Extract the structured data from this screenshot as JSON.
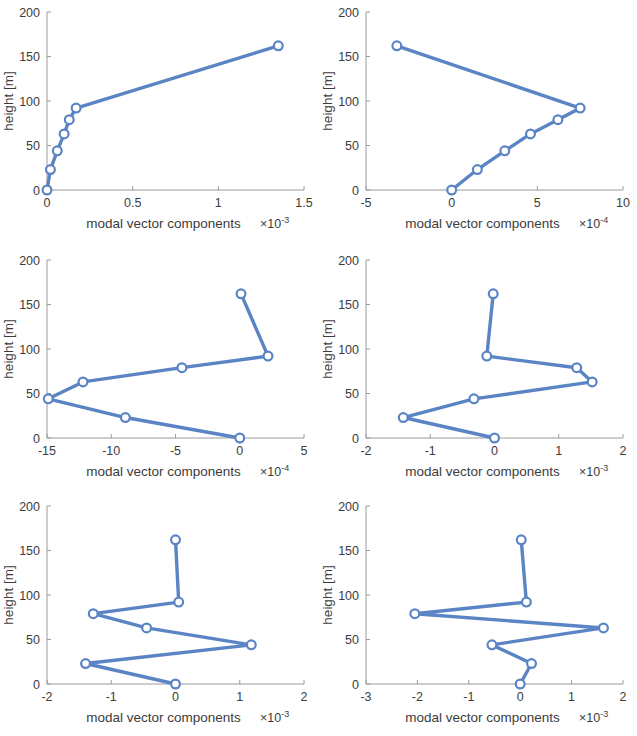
{
  "figure": {
    "title": "",
    "rows": 3,
    "cols": 2,
    "background": "#ffffff",
    "series_color": "#5b84c4"
  },
  "common": {
    "xlabel": "modal vector components",
    "ylabel": "height [m]",
    "y_ticks": [
      0,
      50,
      100,
      150,
      200
    ],
    "y_tick_labels": [
      "0",
      "50",
      "100",
      "150",
      "200"
    ],
    "ylim": [
      0,
      200
    ],
    "exp_times": "×",
    "exp_base": "10"
  },
  "chart_data": [
    {
      "id": "panel-1",
      "type": "line",
      "title": "",
      "xlabel": "modal vector components",
      "ylabel": "height [m]",
      "x_exponent": "-3",
      "x_exponent_label": "×10⁻³",
      "xlim": [
        0,
        1.5
      ],
      "ylim": [
        0,
        200
      ],
      "x_ticks": [
        0,
        0.5,
        1,
        1.5
      ],
      "x_tick_labels": [
        "0",
        "0.5",
        "1",
        "1.5"
      ],
      "y_ticks": [
        0,
        50,
        100,
        150,
        200
      ],
      "y_tick_labels": [
        "0",
        "50",
        "100",
        "150",
        "200"
      ],
      "grid": false,
      "legend": null,
      "series": [
        {
          "name": "mode 1",
          "x": [
            0.0,
            0.02,
            0.06,
            0.1,
            0.13,
            0.17,
            1.35
          ],
          "y": [
            0,
            23,
            44,
            63,
            79,
            92,
            162
          ]
        }
      ]
    },
    {
      "id": "panel-2",
      "type": "line",
      "title": "",
      "xlabel": "modal vector components",
      "ylabel": "height [m]",
      "x_exponent": "-4",
      "x_exponent_label": "×10⁻⁴",
      "xlim": [
        -5,
        10
      ],
      "ylim": [
        0,
        200
      ],
      "x_ticks": [
        -5,
        0,
        5,
        10
      ],
      "x_tick_labels": [
        "-5",
        "0",
        "5",
        "10"
      ],
      "y_ticks": [
        0,
        50,
        100,
        150,
        200
      ],
      "y_tick_labels": [
        "0",
        "50",
        "100",
        "150",
        "200"
      ],
      "grid": false,
      "legend": null,
      "series": [
        {
          "name": "mode 2",
          "x": [
            0.0,
            1.5,
            3.1,
            4.6,
            6.2,
            7.5,
            -3.2
          ],
          "y": [
            0,
            23,
            44,
            63,
            79,
            92,
            162
          ]
        }
      ]
    },
    {
      "id": "panel-3",
      "type": "line",
      "title": "",
      "xlabel": "modal vector components",
      "ylabel": "height [m]",
      "x_exponent": "-4",
      "x_exponent_label": "×10⁻⁴",
      "xlim": [
        -15,
        5
      ],
      "ylim": [
        0,
        200
      ],
      "x_ticks": [
        -15,
        -10,
        -5,
        0,
        5
      ],
      "x_tick_labels": [
        "-15",
        "-10",
        "-5",
        "0",
        "5"
      ],
      "y_ticks": [
        0,
        50,
        100,
        150,
        200
      ],
      "y_tick_labels": [
        "0",
        "50",
        "100",
        "150",
        "200"
      ],
      "grid": false,
      "legend": null,
      "series": [
        {
          "name": "mode 3",
          "x": [
            0.0,
            -8.9,
            -14.9,
            -12.2,
            -4.5,
            2.2,
            0.1
          ],
          "y": [
            0,
            23,
            44,
            63,
            79,
            92,
            162
          ]
        }
      ]
    },
    {
      "id": "panel-4",
      "type": "line",
      "title": "",
      "xlabel": "modal vector components",
      "ylabel": "height [m]",
      "x_exponent": "-3",
      "x_exponent_label": "×10⁻³",
      "xlim": [
        -2,
        2
      ],
      "ylim": [
        0,
        200
      ],
      "x_ticks": [
        -2,
        -1,
        0,
        1,
        2
      ],
      "x_tick_labels": [
        "-2",
        "-1",
        "0",
        "1",
        "2"
      ],
      "y_ticks": [
        0,
        50,
        100,
        150,
        200
      ],
      "y_tick_labels": [
        "0",
        "50",
        "100",
        "150",
        "200"
      ],
      "grid": false,
      "legend": null,
      "series": [
        {
          "name": "mode 4",
          "x": [
            0.0,
            -1.42,
            -0.32,
            1.52,
            1.28,
            -0.12,
            -0.02
          ],
          "y": [
            0,
            23,
            44,
            63,
            79,
            92,
            162
          ]
        }
      ]
    },
    {
      "id": "panel-5",
      "type": "line",
      "title": "",
      "xlabel": "modal vector components",
      "ylabel": "height [m]",
      "x_exponent": "-3",
      "x_exponent_label": "×10⁻³",
      "xlim": [
        -2,
        2
      ],
      "ylim": [
        0,
        200
      ],
      "x_ticks": [
        -2,
        -1,
        0,
        1,
        2
      ],
      "x_tick_labels": [
        "-2",
        "-1",
        "0",
        "1",
        "2"
      ],
      "y_ticks": [
        0,
        50,
        100,
        150,
        200
      ],
      "y_tick_labels": [
        "0",
        "50",
        "100",
        "150",
        "200"
      ],
      "grid": false,
      "legend": null,
      "series": [
        {
          "name": "mode 5",
          "x": [
            0.0,
            -1.4,
            1.18,
            -0.45,
            -1.28,
            0.05,
            0.0
          ],
          "y": [
            0,
            23,
            44,
            63,
            79,
            92,
            162
          ]
        }
      ]
    },
    {
      "id": "panel-6",
      "type": "line",
      "title": "",
      "xlabel": "modal vector components",
      "ylabel": "height [m]",
      "x_exponent": "-3",
      "x_exponent_label": "×10⁻³",
      "xlim": [
        -3,
        2
      ],
      "ylim": [
        0,
        200
      ],
      "x_ticks": [
        -3,
        -2,
        -1,
        0,
        1,
        2
      ],
      "x_tick_labels": [
        "-3",
        "-2",
        "-1",
        "0",
        "1",
        "2"
      ],
      "y_ticks": [
        0,
        50,
        100,
        150,
        200
      ],
      "y_tick_labels": [
        "0",
        "50",
        "100",
        "150",
        "200"
      ],
      "grid": false,
      "legend": null,
      "series": [
        {
          "name": "mode 6",
          "x": [
            0.0,
            0.22,
            -0.55,
            1.62,
            -2.05,
            0.12,
            0.02
          ],
          "y": [
            0,
            23,
            44,
            63,
            79,
            92,
            162
          ]
        }
      ]
    }
  ]
}
